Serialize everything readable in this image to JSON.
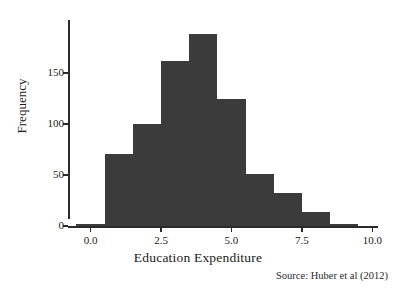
{
  "chart_data": {
    "type": "bar",
    "title": "",
    "xlabel": "Education Expenditure",
    "ylabel": "Frequency",
    "source_note": "Source: Huber et al (2012)",
    "xlim": [
      -0.8,
      10.2
    ],
    "ylim": [
      0,
      200
    ],
    "grid": false,
    "legend": null,
    "bar_color": "#3b3b3b",
    "axis_color": "#2b2b2b",
    "bin_width": 1.0,
    "xticks": [
      {
        "value": 0.0,
        "label": "0.0"
      },
      {
        "value": 2.5,
        "label": "2.5"
      },
      {
        "value": 5.0,
        "label": "5.0"
      },
      {
        "value": 7.5,
        "label": "7.5"
      },
      {
        "value": 10.0,
        "label": "10.0"
      }
    ],
    "yticks": [
      {
        "value": 0,
        "label": "0"
      },
      {
        "value": 50,
        "label": "50"
      },
      {
        "value": 100,
        "label": "100"
      },
      {
        "value": 150,
        "label": "150"
      }
    ],
    "bins": [
      {
        "left": -0.5,
        "right": 0.5,
        "center": 0.0,
        "value": 2
      },
      {
        "left": 0.5,
        "right": 1.5,
        "center": 1.0,
        "value": 71
      },
      {
        "left": 1.5,
        "right": 2.5,
        "center": 2.0,
        "value": 100
      },
      {
        "left": 2.5,
        "right": 3.5,
        "center": 3.0,
        "value": 162
      },
      {
        "left": 3.5,
        "right": 4.5,
        "center": 4.0,
        "value": 188
      },
      {
        "left": 4.5,
        "right": 5.5,
        "center": 5.0,
        "value": 125
      },
      {
        "left": 5.5,
        "right": 6.5,
        "center": 6.0,
        "value": 51
      },
      {
        "left": 6.5,
        "right": 7.5,
        "center": 7.0,
        "value": 32
      },
      {
        "left": 7.5,
        "right": 8.5,
        "center": 8.0,
        "value": 14
      },
      {
        "left": 8.5,
        "right": 9.5,
        "center": 9.0,
        "value": 2
      }
    ],
    "categories": [
      "0.0",
      "1.0",
      "2.0",
      "3.0",
      "4.0",
      "5.0",
      "6.0",
      "7.0",
      "8.0",
      "9.0"
    ],
    "values": [
      2,
      71,
      100,
      162,
      188,
      125,
      51,
      32,
      14,
      2
    ]
  }
}
